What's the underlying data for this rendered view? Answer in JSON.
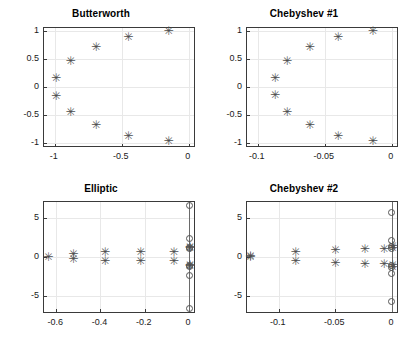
{
  "figure": {
    "width": 405,
    "height": 347,
    "background": "#ffffff",
    "marker_colors": {
      "pole": "#4d4d4d",
      "zero": "#555555",
      "grid": "#e8e8e8",
      "axis": "#3a3a3a"
    },
    "marker_names": {
      "pole": "pole-marker",
      "zero": "zero-marker"
    }
  },
  "chart_data": [
    {
      "id": "butterworth",
      "type": "scatter",
      "title": "Butterworth",
      "xlabel": "",
      "ylabel": "",
      "xlim": [
        -1.08,
        0.04
      ],
      "ylim": [
        -1.06,
        1.06
      ],
      "xticks": [
        -1,
        -0.5,
        0
      ],
      "xticklabels": [
        "-1",
        "-0.5",
        "0"
      ],
      "yticks": [
        1,
        0.5,
        0,
        -0.5,
        -1
      ],
      "yticklabels": [
        "1",
        "0.5",
        "0",
        "-0.5",
        "-1"
      ],
      "grid": true,
      "legend": null,
      "series": [
        {
          "name": "poles",
          "marker": "asterisk",
          "points": [
            [
              -0.155,
              1.0
            ],
            [
              -0.455,
              0.895
            ],
            [
              -0.695,
              0.715
            ],
            [
              -0.885,
              0.465
            ],
            [
              -0.995,
              0.16
            ],
            [
              -0.995,
              -0.165
            ],
            [
              -0.885,
              -0.46
            ],
            [
              -0.695,
              -0.7
            ],
            [
              -0.455,
              -0.89
            ],
            [
              -0.155,
              -0.975
            ]
          ]
        }
      ]
    },
    {
      "id": "chebyshev1",
      "type": "scatter",
      "title": "Chebyshev #1",
      "xlabel": "",
      "ylabel": "",
      "xlim": [
        -0.108,
        0.004
      ],
      "ylim": [
        -1.06,
        1.06
      ],
      "xticks": [
        -0.1,
        -0.05,
        0
      ],
      "xticklabels": [
        "-0.1",
        "-0.05",
        "0"
      ],
      "yticks": [
        1,
        0.5,
        0,
        -0.5,
        -1
      ],
      "yticklabels": [
        "1",
        "0.5",
        "0",
        "-0.5",
        "-1"
      ],
      "grid": true,
      "legend": null,
      "series": [
        {
          "name": "poles",
          "marker": "asterisk",
          "points": [
            [
              -0.0145,
              1.0
            ],
            [
              -0.0405,
              0.895
            ],
            [
              -0.0615,
              0.715
            ],
            [
              -0.0785,
              0.465
            ],
            [
              -0.0875,
              0.16
            ],
            [
              -0.0875,
              -0.155
            ],
            [
              -0.0785,
              -0.455
            ],
            [
              -0.0615,
              -0.7
            ],
            [
              -0.0405,
              -0.895
            ],
            [
              -0.0145,
              -0.985
            ]
          ]
        }
      ]
    },
    {
      "id": "elliptic",
      "type": "scatter",
      "title": "Elliptic",
      "xlabel": "",
      "ylabel": "",
      "xlim": [
        -0.655,
        0.022
      ],
      "ylim": [
        -7.0,
        7.0
      ],
      "xticks": [
        -0.6,
        -0.4,
        -0.2,
        0
      ],
      "xticklabels": [
        "-0.6",
        "-0.4",
        "-0.2",
        "0"
      ],
      "yticks": [
        5,
        0,
        -5
      ],
      "yticklabels": [
        "5",
        "0",
        "-5"
      ],
      "grid": true,
      "legend": null,
      "series": [
        {
          "name": "poles",
          "marker": "asterisk",
          "points": [
            [
              -0.638,
              0.0
            ],
            [
              -0.525,
              0.33
            ],
            [
              -0.525,
              -0.3
            ],
            [
              -0.382,
              0.58
            ],
            [
              -0.382,
              -0.55
            ],
            [
              -0.222,
              0.62
            ],
            [
              -0.222,
              -0.58
            ],
            [
              -0.072,
              0.62
            ],
            [
              -0.072,
              -0.58
            ],
            [
              0.0,
              1.05
            ],
            [
              0.0,
              -1.05
            ],
            [
              0.0,
              1.25
            ],
            [
              0.0,
              -1.25
            ]
          ]
        },
        {
          "name": "zeros",
          "marker": "circle",
          "points": [
            [
              0.0,
              6.5
            ],
            [
              0.0,
              2.3
            ],
            [
              0.0,
              1.25
            ],
            [
              0.0,
              1.05
            ],
            [
              0.0,
              -1.05
            ],
            [
              0.0,
              -1.25
            ],
            [
              0.0,
              -2.3
            ],
            [
              0.0,
              -6.5
            ]
          ]
        }
      ]
    },
    {
      "id": "chebyshev2",
      "type": "scatter",
      "title": "Chebyshev #2",
      "xlabel": "",
      "ylabel": "",
      "xlim": [
        -0.128,
        0.0045
      ],
      "ylim": [
        -7.0,
        7.0
      ],
      "xticks": [
        -0.1,
        -0.05,
        0
      ],
      "xticklabels": [
        "-0.1",
        "-0.05",
        "0"
      ],
      "yticks": [
        5,
        0,
        -5
      ],
      "yticklabels": [
        "5",
        "0",
        "-5"
      ],
      "grid": true,
      "legend": null,
      "series": [
        {
          "name": "poles",
          "marker": "asterisk",
          "points": [
            [
              -0.1255,
              0.1
            ],
            [
              -0.1255,
              -0.1
            ],
            [
              -0.0855,
              0.62
            ],
            [
              -0.0855,
              -0.62
            ],
            [
              -0.0505,
              0.85
            ],
            [
              -0.0505,
              -0.85
            ],
            [
              -0.0245,
              0.95
            ],
            [
              -0.0245,
              -0.95
            ],
            [
              -0.0075,
              1.0
            ],
            [
              -0.0075,
              -1.0
            ],
            [
              0.0,
              1.1
            ],
            [
              0.0,
              -1.1
            ],
            [
              0.0,
              1.3
            ],
            [
              0.0,
              -1.3
            ]
          ]
        },
        {
          "name": "zeros",
          "marker": "circle",
          "points": [
            [
              0.0,
              5.7
            ],
            [
              0.0,
              2.1
            ],
            [
              0.0,
              1.3
            ],
            [
              0.0,
              1.1
            ],
            [
              0.0,
              -1.1
            ],
            [
              0.0,
              -1.3
            ],
            [
              0.0,
              -2.1
            ],
            [
              0.0,
              -5.7
            ]
          ]
        }
      ]
    }
  ]
}
